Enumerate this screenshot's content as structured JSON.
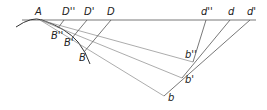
{
  "diagram": {
    "colors": {
      "line": "#555555",
      "label": "#222222",
      "background": "#ffffff"
    },
    "labels": {
      "A": "A",
      "D2": "D''",
      "D1": "D'",
      "D": "D",
      "d2": "d''",
      "d": "d",
      "d1": "d'",
      "B2": "B''",
      "B1": "B'",
      "B": "B",
      "b2": "b''",
      "b1": "b'",
      "b": "b"
    },
    "points": {
      "A": [
        40,
        20
      ],
      "D''": [
        64,
        20
      ],
      "D'": [
        87,
        20
      ],
      "D": [
        111,
        20
      ],
      "d''": [
        206,
        20
      ],
      "d": [
        230,
        20
      ],
      "d'": [
        250,
        20
      ],
      "B''": [
        58,
        28
      ],
      "B'": [
        72,
        38
      ],
      "B": [
        84,
        52
      ],
      "b''": [
        193,
        62
      ],
      "b'": [
        182,
        78
      ],
      "b": [
        164,
        96
      ]
    }
  }
}
